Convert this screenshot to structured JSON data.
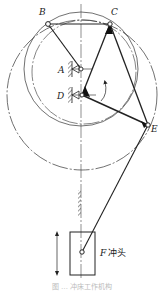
{
  "figure": {
    "title": "冲床工作机构",
    "caption": "图 … 冲床工作机构",
    "colors": {
      "line": "#222222",
      "centerline": "#444444",
      "background": "#ffffff",
      "caption": "#bbbbbb"
    }
  },
  "points": {
    "B": {
      "label": "B",
      "x": 48,
      "y": 24
    },
    "C": {
      "label": "C",
      "x": 110,
      "y": 24
    },
    "A": {
      "label": "A",
      "x": 81,
      "y": 69
    },
    "D": {
      "label": "D",
      "x": 82,
      "y": 95
    },
    "E": {
      "label": "E",
      "x": 148,
      "y": 125
    },
    "F": {
      "label": "F",
      "x": 82,
      "y": 252
    }
  },
  "labels": {
    "B": "B",
    "C": "C",
    "A": "A",
    "D": "D",
    "E": "E",
    "F": "F",
    "slider": "冲头"
  },
  "links": [
    {
      "from": "B",
      "to": "C"
    },
    {
      "from": "B",
      "to": "A"
    },
    {
      "from": "C",
      "to": "D"
    },
    {
      "from": "C",
      "to": "E"
    },
    {
      "from": "D",
      "to": "E"
    },
    {
      "from": "E",
      "to": "F"
    }
  ],
  "circles": [
    {
      "cx": 81,
      "cy": 69,
      "r": 57,
      "style": "solid"
    },
    {
      "cx": 82,
      "cy": 95,
      "r": 75,
      "style": "dash-dot"
    },
    {
      "cx": 84,
      "cy": 72,
      "r": 52,
      "style": "dash-dot"
    }
  ],
  "slider": {
    "x": 70,
    "y": 232,
    "width": 25,
    "height": 43
  },
  "motion_arrow": {
    "x": 57,
    "y1": 232,
    "y2": 275
  },
  "rotation_arrow": {
    "at": "D",
    "direction": "counterclockwise"
  }
}
